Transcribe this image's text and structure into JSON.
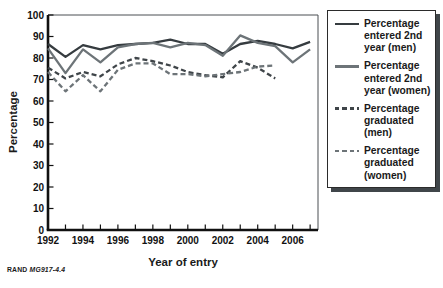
{
  "figure": {
    "ylabel": "Percentage",
    "xlabel": "Year of entry",
    "source_label": "RAND",
    "source_id": "MG917-4.4"
  },
  "legend": {
    "items": [
      {
        "label": "Percentage entered 2nd year (men)",
        "style": "solid",
        "color": "#363c40"
      },
      {
        "label": "Percentage entered 2nd year (women)",
        "style": "solid",
        "color": "#6d7478"
      },
      {
        "label": "Percentage graduated (men)",
        "style": "dashed",
        "color": "#3f4549"
      },
      {
        "label": "Percentage graduated (women)",
        "style": "dashed",
        "color": "#6d7478"
      }
    ]
  },
  "chart_data": {
    "type": "line",
    "title": "",
    "xlabel": "Year of entry",
    "ylabel": "Percentage",
    "xlim": [
      1992,
      2007.45
    ],
    "ylim": [
      0,
      100
    ],
    "y_ticks": [
      0,
      10,
      20,
      30,
      40,
      50,
      60,
      70,
      80,
      90,
      100
    ],
    "x_minor_tick_years": [
      1992,
      1993,
      1994,
      1995,
      1996,
      1997,
      1998,
      1999,
      2000,
      2001,
      2002,
      2003,
      2004,
      2005,
      2006,
      2007
    ],
    "x_tick_labels": [
      1992,
      1994,
      1996,
      1998,
      2000,
      2002,
      2004,
      2006
    ],
    "grid": false,
    "legend_position": "right-outside",
    "series": [
      {
        "name": "Percentage entered 2nd year (men)",
        "style": "solid",
        "color": "#363c40",
        "x": [
          1992,
          1993,
          1994,
          1995,
          1996,
          1997,
          1998,
          1999,
          2000,
          2001,
          2002,
          2003,
          2004,
          2005,
          2006,
          2007
        ],
        "y": [
          86.5,
          80.5,
          86,
          84,
          86,
          86.5,
          87,
          88.5,
          86.5,
          86.5,
          82,
          86.5,
          88,
          86.5,
          84.5,
          87.5
        ]
      },
      {
        "name": "Percentage entered 2nd year (women)",
        "style": "solid",
        "color": "#6d7478",
        "x": [
          1992,
          1993,
          1994,
          1995,
          1996,
          1997,
          1998,
          1999,
          2000,
          2001,
          2002,
          2003,
          2004,
          2005,
          2006,
          2007
        ],
        "y": [
          84.5,
          73,
          84,
          78,
          85,
          86.5,
          87,
          85,
          87,
          86,
          81,
          90.5,
          87,
          85.5,
          78,
          84
        ]
      },
      {
        "name": "Percentage graduated (men)",
        "style": "dashed",
        "color": "#3f4549",
        "x": [
          1992,
          1993,
          1994,
          1995,
          1996,
          1997,
          1998,
          1999,
          2000,
          2001,
          2002,
          2003,
          2004,
          2005
        ],
        "y": [
          75.5,
          70.5,
          73.5,
          71.5,
          77,
          80,
          78.5,
          76.5,
          73.5,
          72,
          71,
          78.5,
          75.5,
          70.5
        ]
      },
      {
        "name": "Percentage graduated (women)",
        "style": "dashed",
        "color": "#6d7478",
        "x": [
          1992,
          1993,
          1994,
          1995,
          1996,
          1997,
          1998,
          1999,
          2000,
          2001,
          2002,
          2003,
          2004,
          2005
        ],
        "y": [
          73.5,
          64.5,
          72,
          64.5,
          74.5,
          77.5,
          77.5,
          72.5,
          72.5,
          71.5,
          72.5,
          73.5,
          76,
          76.5
        ]
      }
    ]
  }
}
